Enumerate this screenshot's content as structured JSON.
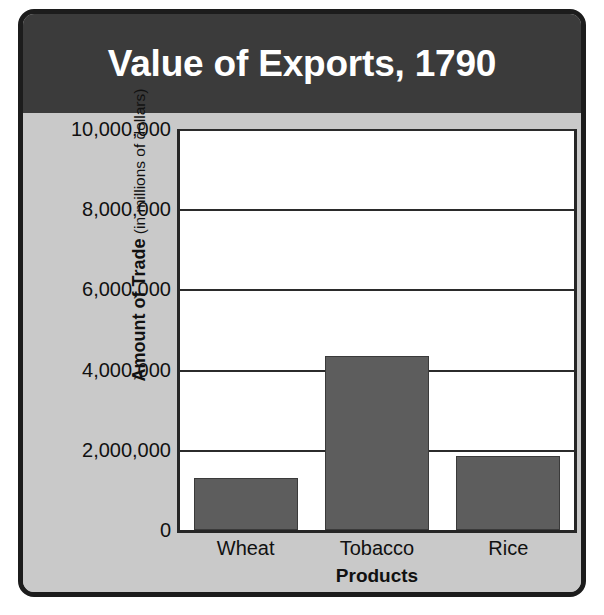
{
  "frame": {
    "border_color": "#1c1c1c",
    "panel_color": "#c9c9c9"
  },
  "banner": {
    "title": "Value of Exports, 1790",
    "background": "#3b3b3b",
    "text_color": "#ffffff"
  },
  "axis": {
    "y_title_strong": "Amount of Trade",
    "y_title_paren": " (in millions of dollars)",
    "x_title": "Products"
  },
  "chart_data": {
    "type": "bar",
    "title": "Value of Exports, 1790",
    "subtitle": "",
    "xlabel": "Products",
    "ylabel": "Amount of Trade (in millions of dollars)",
    "categories": [
      "Wheat",
      "Tobacco",
      "Rice"
    ],
    "values": [
      1300000,
      4350000,
      1850000
    ],
    "ylim": [
      0,
      10000000
    ],
    "ytick_values": [
      0,
      2000000,
      4000000,
      6000000,
      8000000,
      10000000
    ],
    "ytick_labels": [
      "0",
      "2,000,000",
      "4,000,000",
      "6,000,000",
      "8,000,000",
      "10,000,000"
    ],
    "grid": true,
    "grid_axis": "y",
    "legend": false,
    "legend_position": "none",
    "bar_color": "#5d5d5d",
    "bar_edge_color": "#3a3a3a",
    "plot_background": "#ffffff",
    "annotations": []
  }
}
